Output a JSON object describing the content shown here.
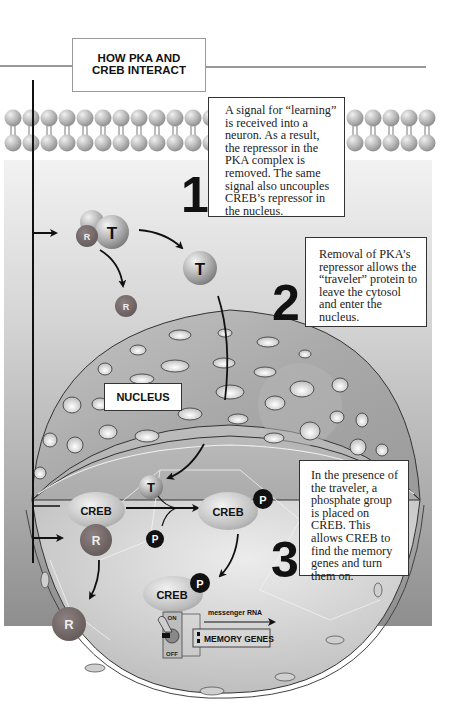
{
  "title": "HOW PKA AND CREB INTERACT",
  "title_lines": [
    "HOW PKA AND",
    "CREB INTERACT"
  ],
  "steps": [
    {
      "number": "1",
      "text": "A signal for “learning” is received into a neuron. As a result, the repressor in the PKA complex is removed. The same signal also uncouples CREB’s repressor in the nucleus."
    },
    {
      "number": "2",
      "text": "Removal of PKA’s repressor allows the “traveler” protein to leave the cytosol and enter the nucleus."
    },
    {
      "number": "3",
      "text": "In the presence of the traveler, a phosphate group is placed on CREB. This allows CREB to find the memory genes and turn them on."
    }
  ],
  "labels": {
    "nucleus": "NUCLEUS",
    "repressor": "R",
    "traveler": "T",
    "phosphate": "P",
    "creb": "CREB",
    "switch_on": "ON",
    "switch_off": "OFF",
    "messenger_rna": "messenger RNA",
    "memory_genes": "MEMORY GENES"
  },
  "colors": {
    "background_gray": "#a8a8a8",
    "repressor": "#7a6e6e",
    "traveler": "#b0b0b0",
    "phosphate": "#111111",
    "creb": "#c8c8c8",
    "text": "#111111"
  }
}
